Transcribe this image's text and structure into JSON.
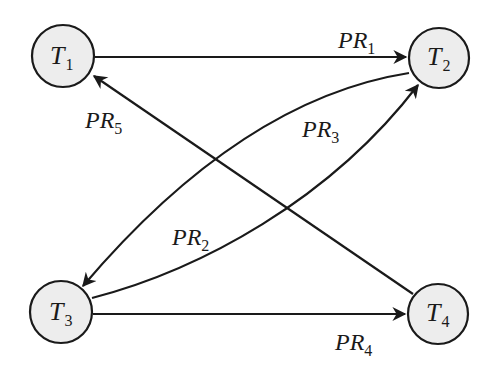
{
  "diagram": {
    "type": "directed-graph",
    "nodes": [
      {
        "id": "T1",
        "main": "T",
        "sub": "1"
      },
      {
        "id": "T2",
        "main": "T",
        "sub": "2"
      },
      {
        "id": "T3",
        "main": "T",
        "sub": "3"
      },
      {
        "id": "T4",
        "main": "T",
        "sub": "4"
      }
    ],
    "edges": [
      {
        "id": "PR1",
        "from": "T1",
        "to": "T2",
        "main": "PR",
        "sub": "1"
      },
      {
        "id": "PR2",
        "from": "T3",
        "to": "T2",
        "main": "PR",
        "sub": "2"
      },
      {
        "id": "PR3",
        "from": "T2",
        "to": "T3",
        "main": "PR",
        "sub": "3"
      },
      {
        "id": "PR4",
        "from": "T3",
        "to": "T4",
        "main": "PR",
        "sub": "4"
      },
      {
        "id": "PR5",
        "from": "T4",
        "to": "T1",
        "main": "PR",
        "sub": "5"
      }
    ],
    "colors": {
      "node_fill": "#ededed",
      "stroke": "#1a1a1a",
      "background": "#ffffff"
    }
  }
}
